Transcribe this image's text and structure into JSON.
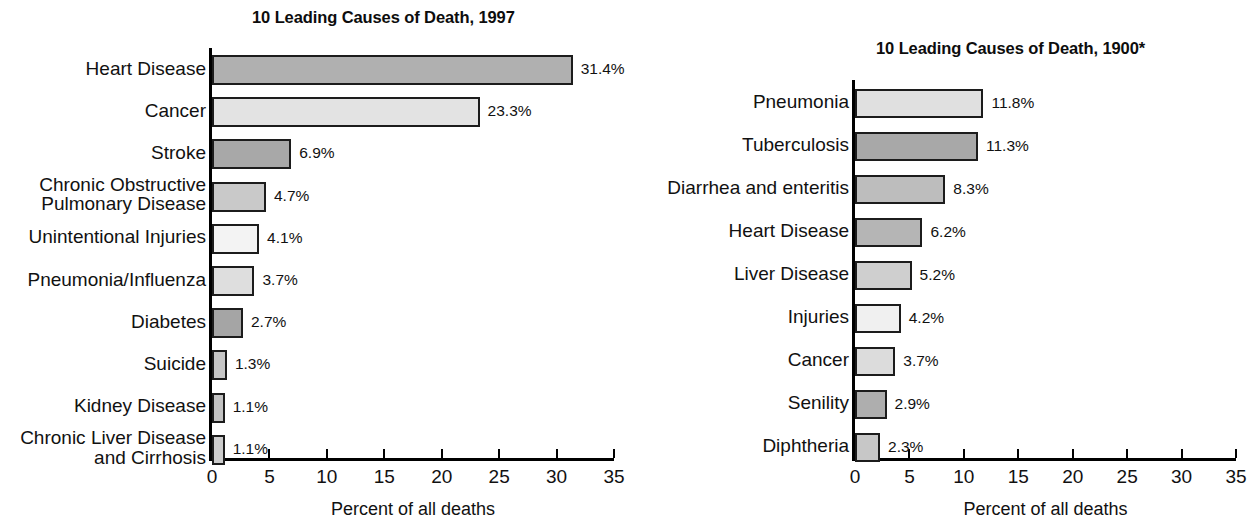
{
  "axis_caption": "Percent of all deaths",
  "chart_data": [
    {
      "type": "bar",
      "orientation": "horizontal",
      "title": "10 Leading Causes of Death, 1997",
      "xlabel": "Percent of all deaths",
      "ylabel": "",
      "xlim": [
        0,
        35
      ],
      "xticks": [
        0,
        5,
        10,
        15,
        20,
        25,
        30,
        35
      ],
      "xtick_labels": [
        "0",
        "5",
        "10",
        "15",
        "20",
        "25",
        "30",
        "35"
      ],
      "grid": false,
      "legend": "none",
      "categories": [
        "Heart Disease",
        "Cancer",
        "Stroke",
        "Chronic Obstructive\nPulmonary Disease",
        "Unintentional Injuries",
        "Pneumonia/Influenza",
        "Diabetes",
        "Suicide",
        "Kidney Disease",
        "Chronic Liver Disease\nand Cirrhosis"
      ],
      "values": [
        31.4,
        23.3,
        6.9,
        4.7,
        4.1,
        3.7,
        2.7,
        1.3,
        1.1,
        1.1
      ],
      "value_labels": [
        "31.4%",
        "23.3%",
        "6.9%",
        "4.7%",
        "4.1%",
        "3.7%",
        "2.7%",
        "1.3%",
        "1.1%",
        "1.1%"
      ],
      "bar_fills": [
        "#b0b0b0",
        "#e3e3e3",
        "#a8a8a8",
        "#c9c9c9",
        "#f3f3f3",
        "#dedede",
        "#a5a5a5",
        "#c6c6c6",
        "#c2c2c2",
        "#cccccc"
      ]
    },
    {
      "type": "bar",
      "orientation": "horizontal",
      "title": "10 Leading Causes of Death, 1900*",
      "xlabel": "Percent of all deaths",
      "ylabel": "",
      "xlim": [
        0,
        35
      ],
      "xticks": [
        0,
        5,
        10,
        15,
        20,
        25,
        30,
        35
      ],
      "xtick_labels": [
        "0",
        "5",
        "10",
        "15",
        "20",
        "25",
        "30",
        "35"
      ],
      "grid": false,
      "legend": "none",
      "categories": [
        "Pneumonia",
        "Tuberculosis",
        "Diarrhea and enteritis",
        "Heart Disease",
        "Liver Disease",
        "Injuries",
        "Cancer",
        "Senility",
        "Diphtheria"
      ],
      "values": [
        11.8,
        11.3,
        8.3,
        6.2,
        5.2,
        4.2,
        3.7,
        2.9,
        2.3
      ],
      "value_labels": [
        "11.8%",
        "11.3%",
        "8.3%",
        "6.2%",
        "5.2%",
        "4.2%",
        "3.7%",
        "2.9%",
        "2.3%"
      ],
      "bar_fills": [
        "#e0e0e0",
        "#a8a8a8",
        "#bdbdbd",
        "#b5b5b5",
        "#cfcfcf",
        "#f0f0f0",
        "#dcdcdc",
        "#aeaeae",
        "#c7c7c7"
      ]
    }
  ]
}
